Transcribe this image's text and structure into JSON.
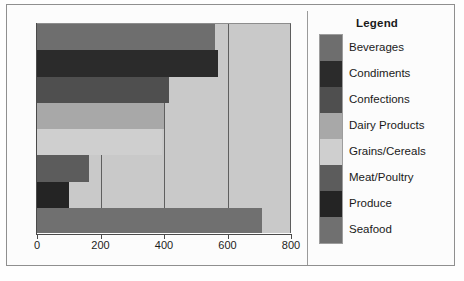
{
  "legend": {
    "title": "Legend",
    "entries": [
      {
        "label": "Beverages",
        "color": "#6e6e6e"
      },
      {
        "label": "Condiments",
        "color": "#2b2b2b"
      },
      {
        "label": "Confections",
        "color": "#4f4f4f"
      },
      {
        "label": "Dairy Products",
        "color": "#a8a8a8"
      },
      {
        "label": "Grains/Cereals",
        "color": "#cfcfcf"
      },
      {
        "label": "Meat/Poultry",
        "color": "#5c5c5c"
      },
      {
        "label": "Produce",
        "color": "#242424"
      },
      {
        "label": "Seafood",
        "color": "#707070"
      }
    ]
  },
  "chart_data": {
    "type": "bar",
    "orientation": "horizontal",
    "title": "",
    "xlabel": "",
    "ylabel": "",
    "xlim": [
      0,
      800
    ],
    "xticks": [
      0,
      200,
      400,
      600,
      800
    ],
    "xticklabels": [
      "0",
      "200",
      "400",
      "600",
      "800"
    ],
    "grid": true,
    "legend_position": "right",
    "categories": [
      "Beverages",
      "Condiments",
      "Confections",
      "Dairy Products",
      "Grains/Cereals",
      "Meat/Poultry",
      "Produce",
      "Seafood"
    ],
    "values": [
      560,
      570,
      415,
      400,
      395,
      165,
      100,
      710
    ],
    "colors": [
      "#6e6e6e",
      "#2b2b2b",
      "#4f4f4f",
      "#a8a8a8",
      "#cfcfcf",
      "#5c5c5c",
      "#242424",
      "#707070"
    ],
    "plot_background": "#c9c9c9"
  }
}
